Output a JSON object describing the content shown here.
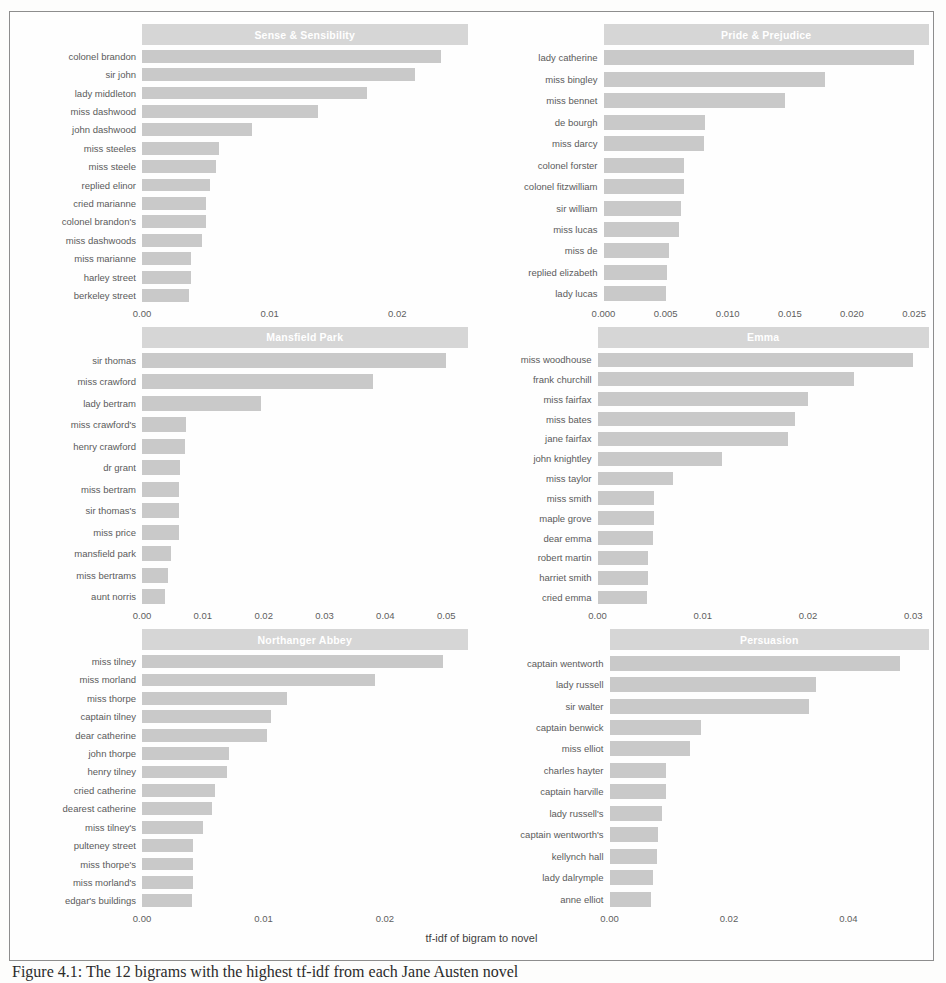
{
  "figure": {
    "x_axis_title": "tf-idf of bigram to novel",
    "caption": "Figure 4.1: The 12 bigrams with the highest tf-idf from each Jane Austen novel",
    "bar_color": "#c9c9c9",
    "strip_color": "#d6d6d6",
    "strip_text_color": "#ffffff"
  },
  "chart_data": {
    "type": "bar",
    "title": "",
    "xlabel": "tf-idf of bigram to novel",
    "ylabel": "",
    "grid": false,
    "legend": "none",
    "orientation": "horizontal",
    "facets": [
      {
        "name": "Sense & Sensibility",
        "xlim": [
          0,
          0.0255
        ],
        "xticks": [
          "0.00",
          "0.01",
          "0.02"
        ],
        "xtick_values": [
          0.0,
          0.01,
          0.02
        ],
        "categories": [
          "colonel brandon",
          "sir john",
          "lady middleton",
          "miss dashwood",
          "john dashwood",
          "miss steeles",
          "miss steele",
          "replied elinor",
          "cried marianne",
          "colonel brandon's",
          "miss dashwoods",
          "miss marianne",
          "harley street",
          "berkeley street"
        ],
        "values": [
          0.0234,
          0.0214,
          0.0176,
          0.0138,
          0.0086,
          0.006,
          0.0058,
          0.0053,
          0.005,
          0.005,
          0.0047,
          0.0038,
          0.0038,
          0.0037
        ]
      },
      {
        "name": "Pride & Prejudice",
        "xlim": [
          0,
          0.0262
        ],
        "xticks": [
          "0.000",
          "0.005",
          "0.010",
          "0.015",
          "0.020",
          "0.025"
        ],
        "xtick_values": [
          0.0,
          0.005,
          0.01,
          0.015,
          0.02,
          0.025
        ],
        "categories": [
          "lady catherine",
          "miss bingley",
          "miss bennet",
          "de bourgh",
          "miss darcy",
          "colonel forster",
          "colonel fitzwilliam",
          "sir william",
          "miss lucas",
          "miss de",
          "replied elizabeth",
          "lady lucas"
        ],
        "values": [
          0.025,
          0.0178,
          0.0146,
          0.0082,
          0.0081,
          0.0065,
          0.0065,
          0.0062,
          0.0061,
          0.0053,
          0.0051,
          0.005
        ]
      },
      {
        "name": "Mansfield Park",
        "xlim": [
          0,
          0.0535
        ],
        "xticks": [
          "0.00",
          "0.01",
          "0.02",
          "0.03",
          "0.04",
          "0.05"
        ],
        "xtick_values": [
          0.0,
          0.01,
          0.02,
          0.03,
          0.04,
          0.05
        ],
        "categories": [
          "sir thomas",
          "miss crawford",
          "lady bertram",
          "miss crawford's",
          "henry crawford",
          "dr grant",
          "miss bertram",
          "sir thomas's",
          "miss price",
          "mansfield park",
          "miss bertrams",
          "aunt norris"
        ],
        "values": [
          0.05,
          0.038,
          0.0196,
          0.0072,
          0.0071,
          0.0062,
          0.0061,
          0.006,
          0.006,
          0.0048,
          0.0042,
          0.0038
        ]
      },
      {
        "name": "Emma",
        "xlim": [
          0,
          0.0315
        ],
        "xticks": [
          "0.00",
          "0.01",
          "0.02",
          "0.03"
        ],
        "xtick_values": [
          0.0,
          0.01,
          0.02,
          0.03
        ],
        "categories": [
          "miss woodhouse",
          "frank churchill",
          "miss fairfax",
          "miss bates",
          "jane fairfax",
          "john knightley",
          "miss taylor",
          "miss smith",
          "maple grove",
          "dear emma",
          "robert martin",
          "harriet smith",
          "cried emma"
        ],
        "values": [
          0.03,
          0.0244,
          0.02,
          0.0188,
          0.0181,
          0.0118,
          0.0072,
          0.0054,
          0.0054,
          0.0053,
          0.0048,
          0.0048,
          0.0047
        ]
      },
      {
        "name": "Northanger Abbey",
        "xlim": [
          0,
          0.0268
        ],
        "xticks": [
          "0.00",
          "0.01",
          "0.02"
        ],
        "xtick_values": [
          0.0,
          0.01,
          0.02
        ],
        "categories": [
          "miss tilney",
          "miss morland",
          "miss thorpe",
          "captain tilney",
          "dear catherine",
          "john thorpe",
          "henry tilney",
          "cried catherine",
          "dearest catherine",
          "miss tilney's",
          "pulteney street",
          "miss thorpe's",
          "miss morland's",
          "edgar's buildings"
        ],
        "values": [
          0.0248,
          0.0192,
          0.0119,
          0.0106,
          0.0103,
          0.0072,
          0.007,
          0.006,
          0.0058,
          0.005,
          0.0042,
          0.0042,
          0.0042,
          0.0041
        ]
      },
      {
        "name": "Persuasion",
        "xlim": [
          0,
          0.0535
        ],
        "xticks": [
          "0.00",
          "0.02",
          "0.04"
        ],
        "xtick_values": [
          0.0,
          0.02,
          0.04
        ],
        "categories": [
          "captain wentworth",
          "lady russell",
          "sir walter",
          "captain benwick",
          "miss elliot",
          "charles hayter",
          "captain harville",
          "lady russell's",
          "captain wentworth's",
          "kellynch hall",
          "lady dalrymple",
          "anne elliot"
        ],
        "values": [
          0.0486,
          0.0346,
          0.0334,
          0.0153,
          0.0135,
          0.0095,
          0.0095,
          0.0088,
          0.0082,
          0.008,
          0.0073,
          0.007
        ]
      }
    ]
  }
}
